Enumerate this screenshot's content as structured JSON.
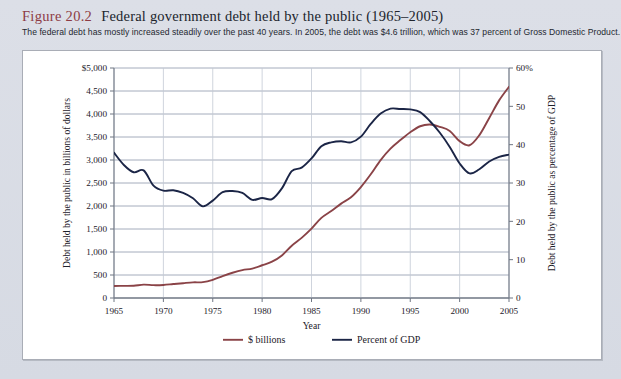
{
  "figure": {
    "number": "Figure 20.2",
    "title": "Federal government debt held by the public (1965–2005)",
    "subtitle": "The federal debt has mostly increased steadily over the past 40 years. In 2005, the debt was $4.6 trillion, which was 37 percent of Gross Domestic Product."
  },
  "colors": {
    "figure_number": "#8d3b44",
    "dollars_line": "#8a4347",
    "gdp_line": "#1b2546",
    "gridline": "#9aa3b4",
    "axis": "#6f7683",
    "panel_bg": "#ffffff",
    "page_bg": "#d9dde5"
  },
  "chart_data": {
    "type": "line",
    "title": "Federal government debt held by the public (1965–2005)",
    "xlabel": "Year",
    "ylabel": "Debt held by the public in billions of dollars",
    "y2label": "Debt held by the public as percentage of GDP",
    "xlim": [
      1965,
      2005
    ],
    "ylim": [
      0,
      5000
    ],
    "y2lim": [
      0,
      60
    ],
    "xticks": [
      1965,
      1970,
      1975,
      1980,
      1985,
      1990,
      1995,
      2000,
      2005
    ],
    "xtick_labels": [
      "1965",
      "1970",
      "1975",
      "1980",
      "1985",
      "1990",
      "1995",
      "2000",
      "2005"
    ],
    "yticks": [
      0,
      500,
      1000,
      1500,
      2000,
      2500,
      3000,
      3500,
      4000,
      4500,
      5000
    ],
    "ytick_labels": [
      "0",
      "500",
      "1,000",
      "1,500",
      "2,000",
      "2,500",
      "3,000",
      "3,500",
      "4,000",
      "4,500",
      "$5,000"
    ],
    "y2ticks": [
      0,
      10,
      20,
      30,
      40,
      50,
      60
    ],
    "y2tick_labels": [
      "0",
      "10",
      "20",
      "30",
      "40",
      "50",
      "60%"
    ],
    "grid": true,
    "legend_position": "below",
    "x": [
      1965,
      1966,
      1967,
      1968,
      1969,
      1970,
      1971,
      1972,
      1973,
      1974,
      1975,
      1976,
      1977,
      1978,
      1979,
      1980,
      1981,
      1982,
      1983,
      1984,
      1985,
      1986,
      1987,
      1988,
      1989,
      1990,
      1991,
      1992,
      1993,
      1994,
      1995,
      1996,
      1997,
      1998,
      1999,
      2000,
      2001,
      2002,
      2003,
      2004,
      2005
    ],
    "series": [
      {
        "name": "$ billions",
        "axis": "left",
        "color": "#8a4347",
        "values": [
          261,
          264,
          267,
          290,
          279,
          283,
          303,
          322,
          340,
          344,
          394,
          477,
          549,
          607,
          640,
          712,
          789,
          925,
          1137,
          1307,
          1507,
          1741,
          1890,
          2051,
          2190,
          2411,
          2689,
          2999,
          3248,
          3433,
          3604,
          3734,
          3772,
          3721,
          3632,
          3410,
          3320,
          3540,
          3913,
          4296,
          4592
        ]
      },
      {
        "name": "Percent of GDP",
        "axis": "right",
        "color": "#1b2546",
        "values": [
          37.9,
          34.7,
          32.8,
          33.3,
          29.3,
          28.0,
          28.1,
          27.4,
          26.0,
          23.9,
          25.4,
          27.6,
          27.9,
          27.4,
          25.6,
          26.1,
          25.8,
          28.6,
          33.1,
          34.0,
          36.4,
          39.6,
          40.6,
          40.9,
          40.6,
          42.1,
          45.4,
          48.1,
          49.4,
          49.3,
          49.2,
          48.5,
          46.1,
          43.1,
          39.4,
          35.1,
          32.5,
          33.6,
          35.6,
          36.8,
          37.4
        ]
      }
    ]
  },
  "legend": [
    {
      "label": "$ billions",
      "color": "#8a4347"
    },
    {
      "label": "Percent of GDP",
      "color": "#1b2546"
    }
  ]
}
